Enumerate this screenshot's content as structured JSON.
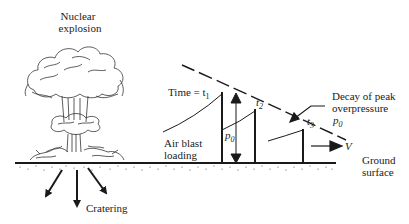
{
  "labels": {
    "explosion_line1": "Nuclear",
    "explosion_line2": "explosion",
    "time_t1": "Time = t",
    "t1_sub": "1",
    "t2": "t",
    "t2_sub": "2",
    "t3": "t",
    "t3_sub": "3",
    "p0": "p",
    "p0_sub": "0",
    "decay_line1": "Decay of peak",
    "decay_line2": "overpressure",
    "decay_p": "p",
    "decay_p_sub": "0",
    "velocity": "V",
    "air_blast_line1": "Air blast",
    "air_blast_line2": "loading",
    "ground_line1": "Ground",
    "ground_line2": "surface",
    "cratering": "Cratering"
  },
  "colors": {
    "ink": "#1a1a1a",
    "background": "#ffffff"
  }
}
